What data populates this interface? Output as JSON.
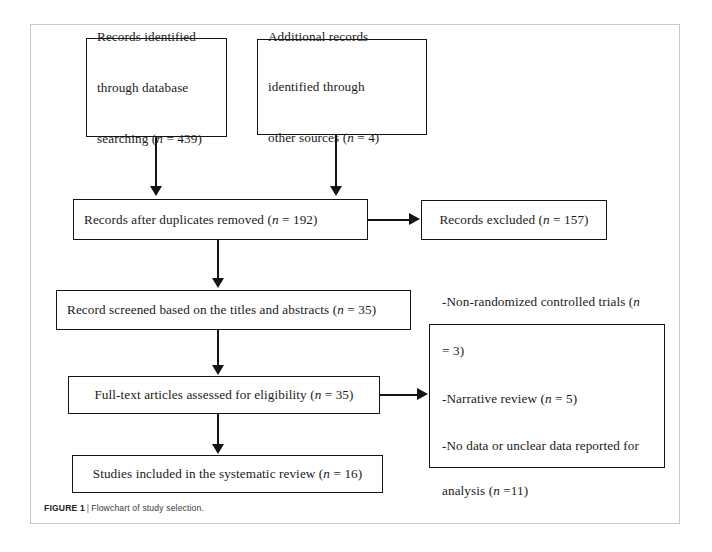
{
  "figure": {
    "label": "FIGURE 1",
    "separator": "|",
    "caption": "Flowchart of study selection."
  },
  "flowchart": {
    "type": "prisma-flow-diagram",
    "boxes": [
      {
        "id": "records-identified-database",
        "text": "Records identified through database searching (n = 439)",
        "lines": [
          "Records identified",
          "through database",
          "searching (n = 439)"
        ],
        "count": 439
      },
      {
        "id": "additional-records-other-sources",
        "text": "Additional records identified through other sources (n = 4)",
        "lines": [
          "Additional records",
          "identified through",
          "other sources (n = 4)"
        ],
        "count": 4
      },
      {
        "id": "records-after-duplicates-removed",
        "text": "Records after duplicates removed (n = 192)",
        "count": 192
      },
      {
        "id": "records-excluded",
        "text": "Records excluded (n = 157)",
        "count": 157
      },
      {
        "id": "records-screened",
        "text": "Record screened based on the titles and abstracts (n = 35)",
        "count": 35
      },
      {
        "id": "full-text-assessed",
        "text": "Full-text articles assessed for eligibility (n = 35)",
        "count": 35
      },
      {
        "id": "full-text-excluded-reasons",
        "lines": [
          "-Non-randomized controlled trials (n",
          "= 3)",
          "-Narrative review (n = 5)",
          "-No data or unclear data reported for",
          "analysis (n =11)"
        ],
        "reasons": [
          {
            "label": "Non-randomized controlled trials",
            "count": 3
          },
          {
            "label": "Narrative review",
            "count": 5
          },
          {
            "label": "No data or unclear data reported for analysis",
            "count": 11
          }
        ]
      },
      {
        "id": "studies-included",
        "text": "Studies included in the systematic review (n = 16)",
        "count": 16
      }
    ],
    "labels": {
      "records_identified_line1": "Records identified",
      "records_identified_line2": "through database",
      "records_identified_line3_pre": "searching (",
      "records_identified_n": "n",
      "records_identified_line3_post": " = 439)",
      "additional_line1": "Additional records",
      "additional_line2": "identified through",
      "additional_line3_pre": "other sources (",
      "additional_n": "n",
      "additional_line3_post": " = 4)",
      "duplicates_pre": "Records after duplicates removed (",
      "duplicates_n": "n",
      "duplicates_post": " = 192)",
      "excluded_pre": "Records excluded (",
      "excluded_n": "n",
      "excluded_post": " = 157)",
      "screened_pre": "Record screened based on the titles and abstracts (",
      "screened_n": "n",
      "screened_post": " = 35)",
      "fulltext_pre": "Full-text articles assessed for eligibility (",
      "fulltext_n": "n",
      "fulltext_post": " = 35)",
      "reason1_pre": "-Non-randomized controlled trials (",
      "reason1_n": "n",
      "reason1_post": "",
      "reason1_cont": "= 3)",
      "reason2_pre": "-Narrative review (",
      "reason2_n": "n",
      "reason2_post": " = 5)",
      "reason3_pre": "-No data or unclear data reported for",
      "reason3_cont_pre": "analysis (",
      "reason3_n": "n",
      "reason3_cont_post": " =11)",
      "included_pre": "Studies included in the systematic review (",
      "included_n": "n",
      "included_post": " = 16)"
    },
    "colors": {
      "box_border": "#141414",
      "connector": "#141414",
      "frame": "#c9c9c9",
      "background": "#ffffff",
      "text": "#1a1a1a"
    }
  }
}
